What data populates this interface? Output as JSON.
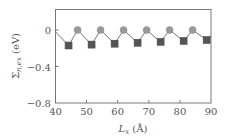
{
  "chart_data": {
    "type": "line",
    "title": "",
    "xlabel": "L_x (Å)",
    "xlabel_main": "L",
    "xlabel_sub": "x",
    "xlabel_unit": " (Å)",
    "ylabel": "Σ_n,ex (eV)",
    "ylabel_main": "Σ",
    "ylabel_sub": "n,ex",
    "ylabel_unit": " (eV)",
    "xlim": [
      40,
      90
    ],
    "ylim": [
      -0.8,
      0.23
    ],
    "xticks": [
      40,
      50,
      60,
      70,
      80,
      90
    ],
    "xtick_labels": [
      "40",
      "50",
      "60",
      "70",
      "80",
      "90"
    ],
    "yticks": [
      0,
      -0.4,
      -0.8
    ],
    "ytick_labels": [
      "0",
      "−0.4",
      "−0.8"
    ],
    "grid": false,
    "legend": null,
    "series": [
      {
        "name": "Σ_n,ex",
        "line_color": "#777777",
        "points": [
          {
            "x": 40.0,
            "y": -0.02,
            "marker": "none"
          },
          {
            "x": 44.2,
            "y": -0.17,
            "marker": "square"
          },
          {
            "x": 47.1,
            "y": 0.0,
            "marker": "circle"
          },
          {
            "x": 51.6,
            "y": -0.16,
            "marker": "square"
          },
          {
            "x": 54.5,
            "y": 0.0,
            "marker": "circle"
          },
          {
            "x": 59.0,
            "y": -0.15,
            "marker": "square"
          },
          {
            "x": 61.9,
            "y": 0.0,
            "marker": "circle"
          },
          {
            "x": 66.4,
            "y": -0.14,
            "marker": "square"
          },
          {
            "x": 69.3,
            "y": 0.0,
            "marker": "circle"
          },
          {
            "x": 73.8,
            "y": -0.13,
            "marker": "square"
          },
          {
            "x": 76.7,
            "y": 0.0,
            "marker": "circle"
          },
          {
            "x": 81.2,
            "y": -0.12,
            "marker": "square"
          },
          {
            "x": 84.1,
            "y": 0.0,
            "marker": "circle"
          },
          {
            "x": 88.6,
            "y": -0.11,
            "marker": "square"
          },
          {
            "x": 90.0,
            "y": -0.06,
            "marker": "none"
          }
        ]
      }
    ],
    "colors": {
      "square_marker": "#555555",
      "circle_marker": "#999999",
      "axis": "#777777",
      "text": "#555555"
    }
  }
}
